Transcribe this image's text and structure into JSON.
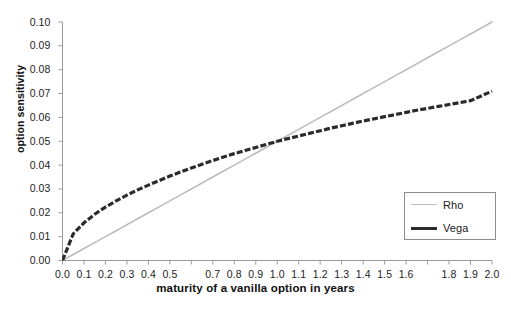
{
  "chart_data": {
    "type": "line",
    "title": "",
    "xlabel": "maturity of a vanilla option in years",
    "ylabel": "option sensitivity",
    "xlim": [
      0.0,
      2.0
    ],
    "ylim": [
      0.0,
      0.1
    ],
    "grid": false,
    "legend_position": "lower-right",
    "x_tick_values": [
      0.0,
      0.1,
      0.2,
      0.3,
      0.4,
      0.5,
      0.6,
      0.7,
      0.8,
      0.9,
      1.0,
      1.1,
      1.2,
      1.3,
      1.4,
      1.5,
      1.6,
      1.7,
      1.8,
      1.9,
      2.0
    ],
    "x_tick_labels": [
      "0.0",
      "0.1",
      "0.2",
      "0.3",
      "0.4",
      "0.5",
      "",
      "0.7",
      "0.8",
      "0.9",
      "1.0",
      "1.1",
      "1.2",
      "1.3",
      "1.4",
      "1.5",
      "1.6",
      "",
      "1.8",
      "1.9",
      "2.0"
    ],
    "y_tick_values": [
      0.0,
      0.01,
      0.02,
      0.03,
      0.04,
      0.05,
      0.06,
      0.07,
      0.08,
      0.09,
      0.1
    ],
    "y_tick_labels": [
      "0.00",
      "0.01",
      "0.02",
      "0.03",
      "0.04",
      "0.05",
      "0.06",
      "0.07",
      "0.08",
      "0.09",
      "0.10"
    ],
    "x": [
      0.0,
      0.05,
      0.1,
      0.15,
      0.2,
      0.25,
      0.3,
      0.35,
      0.4,
      0.45,
      0.5,
      0.55,
      0.6,
      0.65,
      0.7,
      0.75,
      0.8,
      0.85,
      0.9,
      0.95,
      1.0,
      1.05,
      1.1,
      1.15,
      1.2,
      1.25,
      1.3,
      1.35,
      1.4,
      1.45,
      1.5,
      1.55,
      1.6,
      1.65,
      1.7,
      1.75,
      1.8,
      1.85,
      1.9,
      1.95,
      2.0
    ],
    "series": [
      {
        "name": "Rho",
        "color": "#bdbdbd",
        "style": "solid",
        "width": 1.6,
        "values": [
          0.0,
          0.0025,
          0.005,
          0.0075,
          0.01,
          0.0125,
          0.015,
          0.0175,
          0.02,
          0.0225,
          0.025,
          0.0275,
          0.03,
          0.0325,
          0.035,
          0.0375,
          0.04,
          0.0425,
          0.045,
          0.0475,
          0.05,
          0.0525,
          0.055,
          0.0575,
          0.06,
          0.0625,
          0.065,
          0.0675,
          0.07,
          0.0725,
          0.075,
          0.0775,
          0.08,
          0.0825,
          0.085,
          0.0875,
          0.09,
          0.0925,
          0.095,
          0.0975,
          0.1
        ]
      },
      {
        "name": "Vega",
        "color": "#2b2b2b",
        "style": "dashed",
        "width": 3.2,
        "values": [
          0.0,
          0.0112,
          0.0158,
          0.0194,
          0.0224,
          0.025,
          0.0274,
          0.0296,
          0.0316,
          0.0335,
          0.0354,
          0.0371,
          0.0388,
          0.0404,
          0.0419,
          0.0434,
          0.0448,
          0.0461,
          0.0474,
          0.0487,
          0.05,
          0.0511,
          0.0522,
          0.0533,
          0.0544,
          0.0555,
          0.0565,
          0.0575,
          0.0585,
          0.0594,
          0.0603,
          0.0612,
          0.0621,
          0.063,
          0.0638,
          0.0646,
          0.0654,
          0.0662,
          0.067,
          0.069,
          0.071
        ]
      }
    ],
    "intersection": {
      "x": 1.0,
      "y": 0.05
    }
  },
  "legend": {
    "items": [
      {
        "label": "Rho"
      },
      {
        "label": "Vega"
      }
    ]
  }
}
